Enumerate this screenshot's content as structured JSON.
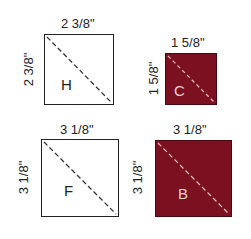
{
  "colors": {
    "fabric": "#7a1020",
    "outline": "#222222",
    "dash_light": "#e8b8bc",
    "dash_dark": "#333333"
  },
  "pieces": [
    {
      "letter": "H",
      "top_dim": "2 3/8\"",
      "side_dim": "2 3/8\"",
      "fill": "white"
    },
    {
      "letter": "C",
      "top_dim": "1 5/8\"",
      "side_dim": "1 5/8\"",
      "fill": "fabric"
    },
    {
      "letter": "F",
      "top_dim": "3 1/8\"",
      "side_dim": "3 1/8\"",
      "fill": "white"
    },
    {
      "letter": "B",
      "top_dim": "3 1/8\"",
      "side_dim": "3 1/8\"",
      "fill": "fabric"
    }
  ]
}
